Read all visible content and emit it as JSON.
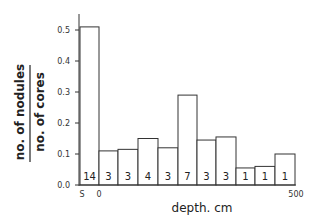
{
  "chart_data": {
    "type": "bar",
    "title": "",
    "xlabel": "depth.  cm",
    "ylabel_numerator": "no. of nodules",
    "ylabel_denominator": "no. of cores",
    "ylim": [
      0.0,
      0.5
    ],
    "y_ticks": [
      "0.0",
      "0.1",
      "0.2",
      "0.3",
      "0.4",
      "0.5"
    ],
    "x_ticks": [
      "S",
      "0",
      "500"
    ],
    "categories": [
      "S",
      "0-50",
      "50-100",
      "100-150",
      "150-200",
      "200-250",
      "250-300",
      "300-350",
      "350-400",
      "400-450",
      "450-500"
    ],
    "values": [
      0.51,
      0.11,
      0.115,
      0.15,
      0.12,
      0.29,
      0.145,
      0.155,
      0.055,
      0.06,
      0.1
    ],
    "counts": [
      14,
      3,
      3,
      4,
      3,
      7,
      3,
      3,
      1,
      1,
      1
    ],
    "grid": false,
    "legend": null
  }
}
